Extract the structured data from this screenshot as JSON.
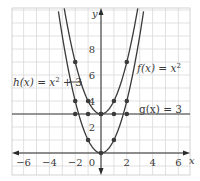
{
  "chart_data": {
    "type": "line",
    "title": "",
    "xlabel": "x",
    "ylabel": "y",
    "xlim": [
      -7,
      7
    ],
    "ylim": [
      -1.7,
      11
    ],
    "grid": true,
    "x_ticks": [
      -6,
      -4,
      -2,
      0,
      2,
      4,
      6
    ],
    "x_tick_labels": [
      "−6",
      "−4",
      "−2",
      "0",
      "2",
      "4",
      "6"
    ],
    "y_ticks": [
      2,
      4,
      6,
      8
    ],
    "y_tick_labels": [
      "2",
      "4",
      "6",
      "8"
    ],
    "series": [
      {
        "name": "f(x) = x²",
        "label_text": "f(x) = x",
        "label_sup": "2",
        "expression": "x^2",
        "points": [
          [
            -2,
            4
          ],
          [
            -1,
            1
          ],
          [
            0,
            0
          ],
          [
            1,
            1
          ],
          [
            2,
            4
          ]
        ]
      },
      {
        "name": "h(x) = x² + 3",
        "label_text": "h(x) = x",
        "label_sup": "2",
        "label_tail": " + 3",
        "expression": "x^2 + 3",
        "points": [
          [
            -2,
            7
          ],
          [
            -1,
            4
          ],
          [
            0,
            3
          ],
          [
            1,
            4
          ],
          [
            2,
            7
          ]
        ]
      },
      {
        "name": "g(x) = 3",
        "label_text": "g(x) = 3",
        "expression": "3",
        "points": [
          [
            -2,
            3
          ],
          [
            -1,
            3
          ],
          [
            0,
            3
          ],
          [
            1,
            3
          ],
          [
            2,
            3
          ]
        ]
      }
    ],
    "colors": {
      "curve": "#3a3a3a",
      "grid": "#d9d9d9",
      "axis": "#2b2b2b",
      "point": "#3a3a3a"
    }
  }
}
